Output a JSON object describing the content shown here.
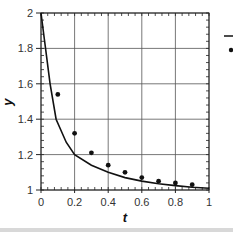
{
  "chart_data": {
    "type": "line",
    "title": "",
    "xlabel": "t",
    "ylabel": "y",
    "xlim": [
      0,
      1
    ],
    "ylim": [
      1,
      2
    ],
    "grid": true,
    "x_ticks": [
      0,
      0.2,
      0.4,
      0.6,
      0.8,
      1
    ],
    "x_tick_labels": [
      "0",
      "0.2",
      "0.4",
      "0.6",
      "0.8",
      "1"
    ],
    "y_ticks": [
      1,
      1.2,
      1.4,
      1.6,
      1.8,
      2
    ],
    "y_tick_labels": [
      "1",
      "1.2",
      "1.4",
      "1.6",
      "1.8",
      "2"
    ],
    "legend": {
      "position": "right-outside",
      "entries": [
        {
          "marker": "line",
          "label": ""
        },
        {
          "marker": "dot",
          "label": ""
        }
      ]
    },
    "series": [
      {
        "name": "curve",
        "kind": "line",
        "color": "#111111",
        "x": [
          0,
          0.02,
          0.054,
          0.09,
          0.15,
          0.2,
          0.3,
          0.4,
          0.5,
          0.6,
          0.7,
          0.8,
          0.9,
          1.0
        ],
        "y": [
          2,
          1.85,
          1.6,
          1.4,
          1.27,
          1.2,
          1.14,
          1.1,
          1.07,
          1.05,
          1.035,
          1.025,
          1.015,
          1.01
        ]
      },
      {
        "name": "points",
        "kind": "scatter",
        "color": "#111111",
        "x": [
          0.1,
          0.2,
          0.3,
          0.4,
          0.5,
          0.6,
          0.7,
          0.8,
          0.9
        ],
        "y": [
          1.54,
          1.32,
          1.21,
          1.14,
          1.1,
          1.07,
          1.05,
          1.04,
          1.03
        ]
      }
    ]
  }
}
